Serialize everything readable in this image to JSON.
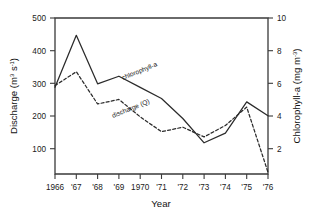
{
  "chart_data": {
    "type": "line",
    "title": "",
    "xlabel": "Year",
    "ylabel": "Discharge (m3 s-1)",
    "y2label": "Chlorophyll-a (mg m-3)",
    "grid": false,
    "legend_position": "inline-annotations",
    "x": [
      1966,
      1967,
      1968,
      1969,
      1970,
      1971,
      1972,
      1973,
      1974,
      1975,
      1976
    ],
    "categories": [
      "1966",
      "'67",
      "'68",
      "'69",
      "1970",
      "'71",
      "'72",
      "'73",
      "'74",
      "'75",
      "'76"
    ],
    "xlim": [
      1966,
      1976
    ],
    "ylim": [
      50,
      500
    ],
    "yticks": [
      100,
      200,
      300,
      400,
      500
    ],
    "yticklabels": [
      "100",
      "200",
      "300",
      "400",
      "500"
    ],
    "y2lim": [
      1,
      10
    ],
    "y2ticks": [
      2,
      4,
      6,
      8,
      10
    ],
    "y2ticklabels": [
      "2",
      "4",
      "6",
      "8",
      "10"
    ],
    "series": [
      {
        "name": "chlorophyll-a",
        "axis": "right",
        "style": "solid",
        "annotation": "chlorophyll-a",
        "values_right_axis": [
          6.0,
          9.0,
          6.2,
          6.65,
          6.0,
          5.35,
          4.2,
          2.8,
          3.35,
          5.15,
          4.35
        ],
        "values": [
          300,
          450,
          310,
          332,
          300,
          268,
          210,
          140,
          168,
          258,
          218
        ]
      },
      {
        "name": "discharge (Q)",
        "axis": "left",
        "style": "dashed",
        "annotation": "discharge (Q)",
        "values": [
          305,
          345,
          252,
          265,
          215,
          172,
          185,
          157,
          190,
          243,
          55
        ]
      }
    ]
  },
  "axes": {
    "left_title_main": "Discharge (m",
    "left_title_sup1": "3",
    "left_title_mid": " s",
    "left_title_sup2": "-1",
    "left_title_end": ")",
    "right_title_main": "Chlorophyll-a (mg m",
    "right_title_sup": "-3",
    "right_title_end": ")",
    "x_title": "Year"
  },
  "annotations": {
    "chlorophyll_label": "chlorophyll-a",
    "discharge_label": "discharge (Q)"
  },
  "colors": {
    "line": "#2b2b2b",
    "axis": "#3a3a3a",
    "text": "#111111",
    "background": "#ffffff"
  }
}
